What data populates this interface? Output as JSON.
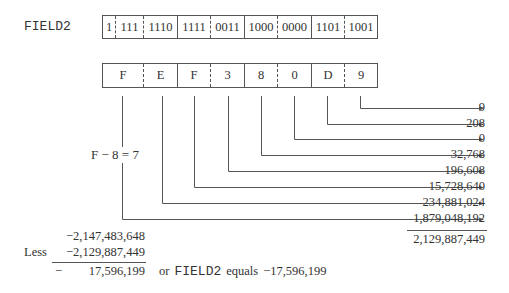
{
  "field_label": "FIELD2",
  "binary_cells": [
    "1",
    "111",
    "1110",
    "1111",
    "0011",
    "1000",
    "0000",
    "1101",
    "1001"
  ],
  "hex_cells": [
    "F",
    "E",
    "F",
    "3",
    "8",
    "0",
    "D",
    "9"
  ],
  "sign_note": "F − 8 = 7",
  "place_values": [
    "9",
    "208",
    "0",
    "32,768",
    "196,608",
    "15,728,640",
    "234,881,024",
    "1,879,048,192"
  ],
  "sum_total": "2,129,887,449",
  "subtraction": {
    "minuend": "−2,147,483,648",
    "less_label": "Less",
    "subtrahend": "−2,129,887,449",
    "result_sign": "−",
    "result_value": "17,596,199",
    "conclusion_prefix": "or",
    "conclusion_field": "FIELD2",
    "conclusion_verb": "equals",
    "conclusion_value": "−17,596,199"
  }
}
